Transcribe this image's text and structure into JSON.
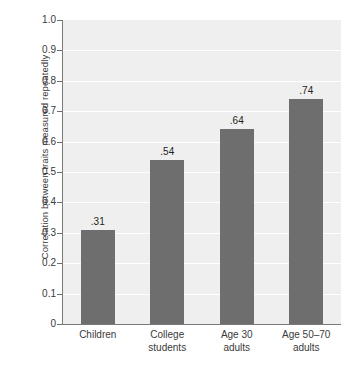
{
  "chart_data": {
    "type": "bar",
    "title": "",
    "subtitle": "",
    "xlabel": "",
    "ylabel": "Correlation between traits measured repeatedly",
    "categories": [
      "Children",
      "College\nstudents",
      "Age 30\nadults",
      "Age 50–70\nadults"
    ],
    "values": [
      0.31,
      0.54,
      0.64,
      0.74
    ],
    "value_labels": [
      ".31",
      ".54",
      ".64",
      ".74"
    ],
    "ylim": [
      0,
      1.0
    ],
    "ytick_values": [
      0,
      0.1,
      0.2,
      0.3,
      0.4,
      0.5,
      0.6,
      0.7,
      0.8,
      0.9,
      1.0
    ],
    "ytick_labels": [
      "0",
      "0.1",
      "0.2",
      "0.3",
      "0.4",
      "0.5",
      "0.6",
      "0.7",
      "0.8",
      "0.9",
      "1.0"
    ],
    "grid": true,
    "grid_orientation": "horizontal",
    "legend": false,
    "legend_position": "none",
    "bar_color": "#6e6e6e",
    "plot_background": "#efefef",
    "gridline_color": "#ffffff",
    "axis_color": "#7a7a7a",
    "text_color": "#3a3a3a",
    "page_background": "#ffffff"
  }
}
